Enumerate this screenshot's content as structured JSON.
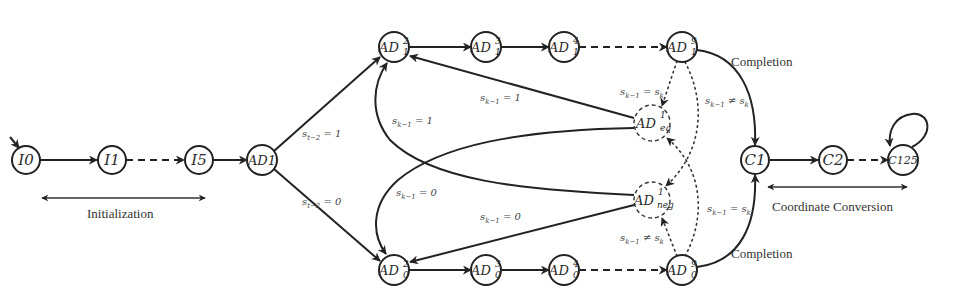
{
  "diagram": {
    "type": "state-machine",
    "nodes": [
      {
        "id": "I0",
        "base": "I0",
        "sup": "",
        "sub": "",
        "x": 26,
        "y": 160,
        "style": "solid",
        "initial": true
      },
      {
        "id": "I1",
        "base": "I1",
        "sup": "",
        "sub": "",
        "x": 112,
        "y": 160,
        "style": "solid"
      },
      {
        "id": "I5",
        "base": "I5",
        "sup": "",
        "sub": "",
        "x": 199,
        "y": 160,
        "style": "solid"
      },
      {
        "id": "AD1",
        "base": "AD1",
        "sup": "",
        "sub": "",
        "x": 262,
        "y": 160,
        "style": "solid"
      },
      {
        "id": "AD1_2",
        "base": "AD",
        "sup": "2",
        "sub": "1",
        "x": 394,
        "y": 47,
        "style": "solid"
      },
      {
        "id": "AD1_3",
        "base": "AD",
        "sup": "3",
        "sub": "1",
        "x": 486,
        "y": 47,
        "style": "solid"
      },
      {
        "id": "AD1_4",
        "base": "AD",
        "sup": "4",
        "sub": "1",
        "x": 564,
        "y": 47,
        "style": "solid"
      },
      {
        "id": "AD1_9",
        "base": "AD",
        "sup": "9",
        "sub": "1",
        "x": 682,
        "y": 47,
        "style": "solid"
      },
      {
        "id": "ADeq",
        "base": "AD",
        "sup": "1",
        "sub": "eq",
        "x": 652,
        "y": 123,
        "style": "dashed"
      },
      {
        "id": "ADneg",
        "base": "AD",
        "sup": "1",
        "sub": "neg",
        "x": 652,
        "y": 200,
        "style": "dashed"
      },
      {
        "id": "AD0_2",
        "base": "AD",
        "sup": "2",
        "sub": "0",
        "x": 394,
        "y": 270,
        "style": "solid"
      },
      {
        "id": "AD0_3",
        "base": "AD",
        "sup": "3",
        "sub": "0",
        "x": 486,
        "y": 270,
        "style": "solid"
      },
      {
        "id": "AD0_4",
        "base": "AD",
        "sup": "4",
        "sub": "0",
        "x": 564,
        "y": 270,
        "style": "solid"
      },
      {
        "id": "AD0_9",
        "base": "AD",
        "sup": "9",
        "sub": "0",
        "x": 682,
        "y": 270,
        "style": "solid"
      },
      {
        "id": "C1",
        "base": "C1",
        "sup": "",
        "sub": "",
        "x": 755,
        "y": 160,
        "style": "solid"
      },
      {
        "id": "C2",
        "base": "C2",
        "sup": "",
        "sub": "",
        "x": 833,
        "y": 160,
        "style": "solid"
      },
      {
        "id": "C125",
        "base": "C125",
        "sup": "",
        "sub": "",
        "x": 903,
        "y": 160,
        "style": "solid",
        "self_loop": true
      }
    ],
    "edges": [
      {
        "from": "start",
        "to": "I0",
        "style": "solid"
      },
      {
        "from": "I0",
        "to": "I1",
        "style": "solid"
      },
      {
        "from": "I1",
        "to": "I5",
        "style": "dashed"
      },
      {
        "from": "I5",
        "to": "AD1",
        "style": "solid"
      },
      {
        "from": "AD1",
        "to": "AD1_2",
        "style": "solid",
        "label": "s_{t-2} = 1"
      },
      {
        "from": "AD1",
        "to": "AD0_2",
        "style": "solid",
        "label": "s_{t-2} = 0"
      },
      {
        "from": "AD1_2",
        "to": "AD1_3",
        "style": "solid"
      },
      {
        "from": "AD1_3",
        "to": "AD1_4",
        "style": "solid"
      },
      {
        "from": "AD1_4",
        "to": "AD1_9",
        "style": "dashed"
      },
      {
        "from": "AD0_2",
        "to": "AD0_3",
        "style": "solid"
      },
      {
        "from": "AD0_3",
        "to": "AD0_4",
        "style": "solid"
      },
      {
        "from": "AD0_4",
        "to": "AD0_9",
        "style": "dashed"
      },
      {
        "from": "ADeq",
        "to": "AD1_2",
        "style": "solid",
        "label": "s_{k-1} = 1"
      },
      {
        "from": "ADneg",
        "to": "AD1_2",
        "style": "solid",
        "label": "s_{k-1} = 1"
      },
      {
        "from": "ADeq",
        "to": "AD0_2",
        "style": "solid",
        "label": "s_{k-1} = 0"
      },
      {
        "from": "ADneg",
        "to": "AD0_2",
        "style": "solid",
        "label": "s_{k-1} = 0"
      },
      {
        "from": "AD1_9",
        "to": "ADeq",
        "style": "dotted",
        "label": "s_{k-1} = s_k"
      },
      {
        "from": "AD1_9",
        "to": "ADneg",
        "style": "dotted",
        "label": "s_{k-1} ≠ s_k"
      },
      {
        "from": "AD0_9",
        "to": "ADneg",
        "style": "dotted",
        "label": "s_{k-1} ≠ s_k"
      },
      {
        "from": "AD0_9",
        "to": "ADeq",
        "style": "dotted",
        "label": "s_{k-1} = s_k"
      },
      {
        "from": "AD1_9",
        "to": "C1",
        "style": "solid",
        "label": "Completion"
      },
      {
        "from": "AD0_9",
        "to": "C1",
        "style": "solid",
        "label": "Completion"
      },
      {
        "from": "C1",
        "to": "C2",
        "style": "solid"
      },
      {
        "from": "C2",
        "to": "C125",
        "style": "dashed"
      },
      {
        "from": "C125",
        "to": "C125",
        "style": "solid"
      }
    ]
  },
  "labels": {
    "I0": "I0",
    "I1": "I1",
    "I5": "I5",
    "AD1": "AD1",
    "AD": "AD",
    "C1": "C1",
    "C2": "C2",
    "C125": "C125",
    "sup2": "2",
    "sup3": "3",
    "sup4": "4",
    "sup9": "9",
    "sup1": "1",
    "sub1": "1",
    "sub0": "0",
    "subeq": "eq",
    "subneg": "neg",
    "st2_1": "s",
    "edge_st2_eq1_sub": "t−2",
    "edge_st2_eq1_rest": " = 1",
    "edge_st2_eq0_rest": " = 0",
    "s": "s",
    "sk1": "k−1",
    "sk": "k",
    "eq1": " = 1",
    "eq0": " = 0",
    "eq_sk": " = s",
    "neq_sk": " ≠ s",
    "completion_top": "Completion",
    "completion_bottom": "Completion",
    "initialization": "Initialization",
    "coordinate_conversion": "Coordinate Conversion"
  }
}
